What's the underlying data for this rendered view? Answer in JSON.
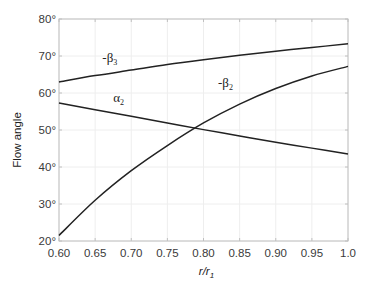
{
  "chart_data": {
    "type": "line",
    "title": "",
    "xlabel": "r/r1",
    "xlabel_main": "r/r",
    "xlabel_sub": "1",
    "ylabel": "Flow angle",
    "xlim": [
      0.6,
      1.0
    ],
    "ylim": [
      20,
      80
    ],
    "grid": true,
    "legend": "none (inline curve labels)",
    "x_ticks": [
      0.6,
      0.65,
      0.7,
      0.75,
      0.8,
      0.85,
      0.9,
      0.95,
      1.0
    ],
    "x_tick_labels": [
      "0.60",
      "0.65",
      "0.70",
      "0.75",
      "0.80",
      "0.85",
      "0.90",
      "0.95",
      "1.0"
    ],
    "y_ticks": [
      20,
      30,
      40,
      50,
      60,
      70,
      80
    ],
    "y_tick_labels": [
      "20°",
      "30°",
      "40°",
      "50°",
      "60°",
      "70°",
      "80°"
    ],
    "x": [
      0.6,
      0.65,
      0.7,
      0.75,
      0.8,
      0.85,
      0.9,
      0.95,
      1.0
    ],
    "series": [
      {
        "name": "-β3",
        "label_main": "-β",
        "label_sub": "3",
        "values": [
          63.0,
          64.7,
          66.2,
          67.7,
          69.0,
          70.2,
          71.3,
          72.3,
          73.3
        ],
        "label_pos": [
          0.66,
          68.5
        ]
      },
      {
        "name": "α2",
        "label_main": "α",
        "label_sub": "2",
        "values": [
          57.3,
          55.5,
          53.7,
          51.9,
          50.1,
          48.4,
          46.7,
          45.1,
          43.5
        ],
        "label_pos": [
          0.675,
          57.5
        ]
      },
      {
        "name": "-β2",
        "label_main": "-β",
        "label_sub": "2",
        "values": [
          21.5,
          31.0,
          39.0,
          45.8,
          51.9,
          57.0,
          61.2,
          64.6,
          67.2
        ],
        "label_pos": [
          0.82,
          61.5
        ]
      }
    ],
    "colors": {
      "curve": "#222222",
      "frame": "#c0c0c0",
      "grid": "#eeeeee",
      "tick_text": "#3a3a3a"
    }
  }
}
